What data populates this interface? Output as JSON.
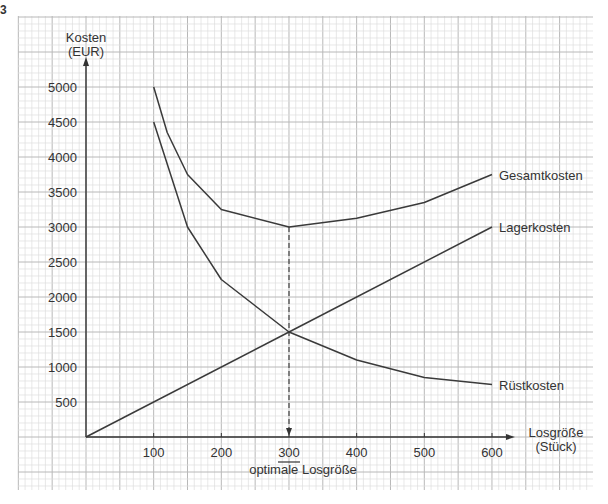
{
  "corner_mark": "3",
  "chart_data": {
    "type": "line",
    "title": "",
    "xlabel": "Losgröße (Stück)",
    "ylabel": "Kosten (EUR)",
    "xlabel_lines": [
      "Losgröße",
      "(Stück)"
    ],
    "ylabel_lines": [
      "Kosten",
      "(EUR)"
    ],
    "xlim": [
      0,
      600
    ],
    "ylim": [
      0,
      5000
    ],
    "x_ticks": [
      100,
      200,
      300,
      400,
      500,
      600
    ],
    "y_ticks": [
      500,
      1000,
      1500,
      2000,
      2500,
      3000,
      3500,
      4000,
      4500,
      5000
    ],
    "grid": true,
    "legend_position": "inline-right",
    "series": [
      {
        "name": "Gesamtkosten",
        "x": [
          100,
          120,
          150,
          200,
          300,
          400,
          500,
          600
        ],
        "values": [
          5000,
          4350,
          3750,
          3250,
          3000,
          3125,
          3350,
          3750
        ]
      },
      {
        "name": "Lagerkosten",
        "x": [
          0,
          300,
          600
        ],
        "values": [
          0,
          1500,
          3000
        ]
      },
      {
        "name": "Rüstkosten",
        "x": [
          100,
          150,
          200,
          300,
          400,
          500,
          600
        ],
        "values": [
          4500,
          3000,
          2250,
          1500,
          1100,
          850,
          750
        ]
      }
    ],
    "annotations": [
      {
        "text": "300",
        "x": 300,
        "underline": true,
        "note": "dashed vertical line from Gesamtkosten minimum to x-axis with arrow"
      },
      {
        "text": "optimale Losgröße",
        "x": 300
      }
    ]
  },
  "optimum": {
    "value": "300",
    "label": "optimale Losgröße"
  }
}
